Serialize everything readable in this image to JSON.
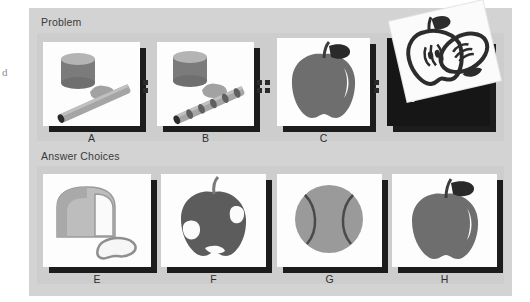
{
  "page": {
    "margin_glyph": "d",
    "background_color": "#ffffff",
    "card_color": "#d3d3d3"
  },
  "problem": {
    "label": "Problem",
    "panels": [
      {
        "letter": "A",
        "icon": "cylinder-blob-rod-icon",
        "description": "carrot rod whole beside cylinder and blob"
      },
      {
        "letter": "B",
        "icon": "cylinder-blob-sliced-rod-icon",
        "description": "carrot rod sliced beside cylinder and blob"
      },
      {
        "letter": "C",
        "icon": "whole-apple-icon",
        "description": "whole apple silhouette"
      },
      {
        "letter": "D",
        "icon": "question-mark-icon",
        "description": "unknown answer, dark card with question mark"
      }
    ],
    "separators": [
      {
        "after": "A",
        "glyph": "colon",
        "dots": 2
      },
      {
        "after": "B",
        "glyph": "double-colon",
        "dots": 4
      },
      {
        "after": "C",
        "glyph": "colon",
        "dots": 2
      }
    ],
    "unknown_marker": "?",
    "overlay": {
      "icon": "cut-apple-outline-icon",
      "description": "tilted photo of apple cut in half, outline style"
    }
  },
  "answer_choices": {
    "label": "Answer Choices",
    "panels": [
      {
        "letter": "E",
        "icon": "bread-loaf-slice-icon",
        "description": "loaf of bread with one slice"
      },
      {
        "letter": "F",
        "icon": "bitten-apple-icon",
        "description": "apple with bites taken out"
      },
      {
        "letter": "G",
        "icon": "ball-icon",
        "description": "tennis ball"
      },
      {
        "letter": "H",
        "icon": "whole-apple-icon",
        "description": "whole apple silhouette"
      }
    ]
  },
  "colors": {
    "tile_face": "#fdfdfd",
    "tile_shadow": "#1c1c1c",
    "object_gray": "#777777",
    "object_light": "#a8a8a8",
    "dark_panel": "#161616"
  }
}
